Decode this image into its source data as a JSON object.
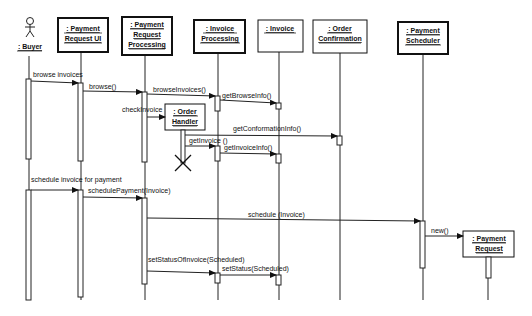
{
  "diagram": {
    "type": "UML sequence diagram",
    "actor": {
      "label": ": Buyer"
    },
    "objects": [
      {
        "id": "pr_ui",
        "lines": [
          ": Payment",
          "Request UI"
        ]
      },
      {
        "id": "pr_proc",
        "lines": [
          ": Payment",
          "Request",
          "Processing"
        ]
      },
      {
        "id": "inv_proc",
        "lines": [
          ": Invoice",
          "Processing"
        ]
      },
      {
        "id": "invoice",
        "lines": [
          ": Invoice"
        ]
      },
      {
        "id": "order_conf",
        "lines": [
          ": Order",
          "Confirmation"
        ]
      },
      {
        "id": "pay_sched",
        "lines": [
          ": Payment",
          "Scheduler"
        ]
      },
      {
        "id": "order_handler",
        "lines": [
          ": Order",
          "Handler"
        ]
      },
      {
        "id": "pay_request",
        "lines": [
          ": Payment",
          "Request"
        ]
      }
    ],
    "messages": [
      {
        "label": "browse invoices",
        "from": "buyer",
        "to": "pr_ui"
      },
      {
        "label": "browse()",
        "from": "pr_ui",
        "to": "pr_proc"
      },
      {
        "label": "browseInvoices()",
        "from": "pr_proc",
        "to": "inv_proc"
      },
      {
        "label": "getBrowseInfo()",
        "from": "inv_proc",
        "to": "invoice"
      },
      {
        "label": "checkInvoice",
        "from": "pr_proc",
        "to": "order_handler"
      },
      {
        "label": "getConformationInfo()",
        "from": "order_handler",
        "to": "order_conf"
      },
      {
        "label": "getInvoice ()",
        "from": "order_handler",
        "to": "inv_proc"
      },
      {
        "label": "getInvoiceInfo()",
        "from": "inv_proc",
        "to": "invoice"
      },
      {
        "label": "schedule invoice for payment",
        "from": "buyer",
        "to": "pr_ui"
      },
      {
        "label": "schedulePayment(Invoice)",
        "from": "pr_ui",
        "to": "pr_proc"
      },
      {
        "label": "schedule (Invoice)",
        "from": "pr_proc",
        "to": "pay_sched"
      },
      {
        "label": "new()",
        "from": "pay_sched",
        "to": "pay_request"
      },
      {
        "label": "setStatusOfInvoice(Scheduled)",
        "from": "pr_proc",
        "to": "inv_proc"
      },
      {
        "label": "setStatus(Scheduled)",
        "from": "inv_proc",
        "to": "invoice"
      }
    ]
  }
}
